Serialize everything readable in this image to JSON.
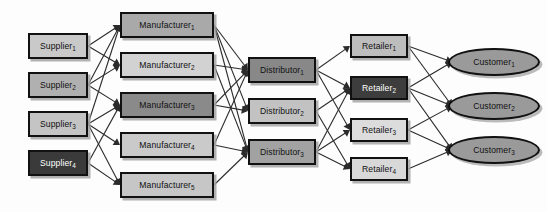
{
  "diagram": {
    "background": "#fdfdfd",
    "tiers": [
      {
        "name": "suppliers",
        "nodes": [
          {
            "id": "S1",
            "label": "Supplier",
            "sub": "1",
            "x": 28,
            "y": 33,
            "w": 60,
            "h": 26,
            "fill": "#c9c9c9",
            "text": "#111111",
            "shape": "rect"
          },
          {
            "id": "S2",
            "label": "Supplier",
            "sub": "2",
            "x": 28,
            "y": 72,
            "w": 60,
            "h": 26,
            "fill": "#b0b0b0",
            "text": "#111111",
            "shape": "rect"
          },
          {
            "id": "S3",
            "label": "Supplier",
            "sub": "3",
            "x": 28,
            "y": 111,
            "w": 60,
            "h": 26,
            "fill": "#c4c4c4",
            "text": "#111111",
            "shape": "rect"
          },
          {
            "id": "S4",
            "label": "Supplier",
            "sub": "4",
            "x": 28,
            "y": 150,
            "w": 60,
            "h": 26,
            "fill": "#3a3a3a",
            "text": "#ffffff",
            "shape": "rect"
          }
        ]
      },
      {
        "name": "manufacturers",
        "nodes": [
          {
            "id": "M1",
            "label": "Manufacturer",
            "sub": "1",
            "x": 120,
            "y": 12,
            "w": 94,
            "h": 26,
            "fill": "#a9a9a9",
            "text": "#111111",
            "shape": "rect"
          },
          {
            "id": "M2",
            "label": "Manufacturer",
            "sub": "2",
            "x": 120,
            "y": 52,
            "w": 94,
            "h": 26,
            "fill": "#d2d2d2",
            "text": "#111111",
            "shape": "rect"
          },
          {
            "id": "M3",
            "label": "Manufacturer",
            "sub": "3",
            "x": 120,
            "y": 92,
            "w": 94,
            "h": 26,
            "fill": "#8a8a8a",
            "text": "#111111",
            "shape": "rect"
          },
          {
            "id": "M4",
            "label": "Manufacturer",
            "sub": "4",
            "x": 120,
            "y": 132,
            "w": 94,
            "h": 26,
            "fill": "#cacaca",
            "text": "#111111",
            "shape": "rect"
          },
          {
            "id": "M5",
            "label": "Manufacturer",
            "sub": "5",
            "x": 120,
            "y": 172,
            "w": 94,
            "h": 26,
            "fill": "#c6c6c6",
            "text": "#111111",
            "shape": "rect"
          }
        ]
      },
      {
        "name": "distributors",
        "nodes": [
          {
            "id": "D1",
            "label": "Distributor",
            "sub": "1",
            "x": 248,
            "y": 57,
            "w": 68,
            "h": 26,
            "fill": "#888888",
            "text": "#111111",
            "shape": "rect"
          },
          {
            "id": "D2",
            "label": "Distributor",
            "sub": "2",
            "x": 248,
            "y": 98,
            "w": 68,
            "h": 26,
            "fill": "#c2c2c2",
            "text": "#111111",
            "shape": "rect"
          },
          {
            "id": "D3",
            "label": "Distributor",
            "sub": "3",
            "x": 248,
            "y": 139,
            "w": 68,
            "h": 26,
            "fill": "#a2a2a2",
            "text": "#111111",
            "shape": "rect"
          }
        ]
      },
      {
        "name": "retailers",
        "nodes": [
          {
            "id": "R1",
            "label": "Retailer",
            "sub": "1",
            "x": 350,
            "y": 34,
            "w": 58,
            "h": 24,
            "fill": "#bdbdbd",
            "text": "#111111",
            "shape": "rect"
          },
          {
            "id": "R2",
            "label": "Retailer",
            "sub": "2",
            "x": 350,
            "y": 76,
            "w": 58,
            "h": 24,
            "fill": "#3d3d3d",
            "text": "#ffffff",
            "shape": "rect"
          },
          {
            "id": "R3",
            "label": "Retailer",
            "sub": "3",
            "x": 350,
            "y": 118,
            "w": 58,
            "h": 24,
            "fill": "#dcdcdc",
            "text": "#111111",
            "shape": "rect"
          },
          {
            "id": "R4",
            "label": "Retailer",
            "sub": "4",
            "x": 350,
            "y": 157,
            "w": 58,
            "h": 24,
            "fill": "#d8d8d8",
            "text": "#111111",
            "shape": "rect"
          }
        ]
      },
      {
        "name": "customers",
        "nodes": [
          {
            "id": "C1",
            "label": "Customer",
            "sub": "1",
            "x": 448,
            "y": 48,
            "w": 92,
            "h": 28,
            "fill": "#9a9a9a",
            "text": "#111111",
            "shape": "ellipse"
          },
          {
            "id": "C2",
            "label": "Customer",
            "sub": "2",
            "x": 448,
            "y": 92,
            "w": 92,
            "h": 28,
            "fill": "#9a9a9a",
            "text": "#111111",
            "shape": "ellipse"
          },
          {
            "id": "C3",
            "label": "Customer",
            "sub": "3",
            "x": 448,
            "y": 136,
            "w": 92,
            "h": 28,
            "fill": "#9a9a9a",
            "text": "#111111",
            "shape": "ellipse"
          }
        ]
      }
    ],
    "edges": [
      {
        "from": "S1",
        "to": "M1"
      },
      {
        "from": "S1",
        "to": "M2"
      },
      {
        "from": "S2",
        "to": "M1"
      },
      {
        "from": "S2",
        "to": "M2"
      },
      {
        "from": "S2",
        "to": "M3"
      },
      {
        "from": "S3",
        "to": "M1"
      },
      {
        "from": "S3",
        "to": "M3"
      },
      {
        "from": "S3",
        "to": "M4"
      },
      {
        "from": "S3",
        "to": "M5"
      },
      {
        "from": "S4",
        "to": "M3"
      },
      {
        "from": "S4",
        "to": "M5"
      },
      {
        "from": "M1",
        "to": "D1"
      },
      {
        "from": "M1",
        "to": "D2"
      },
      {
        "from": "M1",
        "to": "D3"
      },
      {
        "from": "M2",
        "to": "D1"
      },
      {
        "from": "M2",
        "to": "D3"
      },
      {
        "from": "M3",
        "to": "D1"
      },
      {
        "from": "M3",
        "to": "D2"
      },
      {
        "from": "M4",
        "to": "D1"
      },
      {
        "from": "M4",
        "to": "D3"
      },
      {
        "from": "M5",
        "to": "D3"
      },
      {
        "from": "D1",
        "to": "R1"
      },
      {
        "from": "D1",
        "to": "R2"
      },
      {
        "from": "D1",
        "to": "R3"
      },
      {
        "from": "D2",
        "to": "R2"
      },
      {
        "from": "D2",
        "to": "R4"
      },
      {
        "from": "D3",
        "to": "R2"
      },
      {
        "from": "D3",
        "to": "R3"
      },
      {
        "from": "D3",
        "to": "R4"
      },
      {
        "from": "R1",
        "to": "C1"
      },
      {
        "from": "R1",
        "to": "C2"
      },
      {
        "from": "R2",
        "to": "C1"
      },
      {
        "from": "R2",
        "to": "C2"
      },
      {
        "from": "R2",
        "to": "C3"
      },
      {
        "from": "R3",
        "to": "C2"
      },
      {
        "from": "R3",
        "to": "C3"
      },
      {
        "from": "R4",
        "to": "C3"
      }
    ],
    "edge_style": {
      "color": "#2b2b2b",
      "width": 1.1,
      "arrowhead": "solid-triangle"
    }
  }
}
